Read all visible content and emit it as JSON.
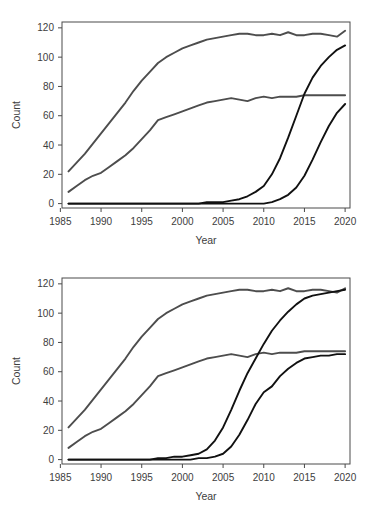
{
  "figure": {
    "watermark_text": "",
    "background_color": "#ffffff",
    "frame_color": "#4a4a4a",
    "gray_series_color": "#4d4d4d",
    "black_series_color": "#111111"
  },
  "charts": [
    {
      "id": "chart-top",
      "type": "line",
      "title": "",
      "xlabel": "Year",
      "ylabel": "Count",
      "xlim": [
        1985.2,
        2020.6
      ],
      "ylim": [
        -3,
        124
      ],
      "xticks": [
        1985,
        1990,
        1995,
        2000,
        2005,
        2010,
        2015,
        2020
      ],
      "xticklabels": [
        "1985",
        "1990",
        "1995",
        "2000",
        "2005",
        "2010",
        "2015",
        "2020"
      ],
      "yticks": [
        0,
        20,
        40,
        60,
        80,
        100,
        120
      ],
      "yticklabels": [
        "0",
        "20",
        "40",
        "60",
        "80",
        "100",
        "120"
      ],
      "grid": false,
      "legend": "none",
      "x": [
        1986,
        1987,
        1988,
        1989,
        1990,
        1991,
        1992,
        1993,
        1994,
        1995,
        1996,
        1997,
        1998,
        1999,
        2000,
        2001,
        2002,
        2003,
        2004,
        2005,
        2006,
        2007,
        2008,
        2009,
        2010,
        2011,
        2012,
        2013,
        2014,
        2015,
        2016,
        2017,
        2018,
        2019,
        2020
      ],
      "series": [
        {
          "name": "series-1-gray-upper",
          "color": "#4d4d4d",
          "values": [
            22,
            28,
            34,
            41,
            48,
            55,
            62,
            69,
            77,
            84,
            90,
            96,
            100,
            103,
            106,
            108,
            110,
            112,
            113,
            114,
            115,
            116,
            116,
            115,
            115,
            116,
            115,
            117,
            115,
            115,
            116,
            116,
            115,
            114,
            118
          ]
        },
        {
          "name": "series-2-gray-lower",
          "color": "#4d4d4d",
          "values": [
            8,
            12,
            16,
            19,
            21,
            25,
            29,
            33,
            38,
            44,
            50,
            57,
            59,
            61,
            63,
            65,
            67,
            69,
            70,
            71,
            72,
            71,
            70,
            72,
            73,
            72,
            73,
            73,
            73,
            74,
            74,
            74,
            74,
            74,
            74
          ]
        },
        {
          "name": "series-3-black-steep",
          "color": "#111111",
          "values": [
            0,
            0,
            0,
            0,
            0,
            0,
            0,
            0,
            0,
            0,
            0,
            0,
            0,
            0,
            0,
            0,
            0,
            1,
            1,
            1,
            2,
            3,
            5,
            8,
            12,
            20,
            31,
            45,
            60,
            75,
            86,
            94,
            100,
            105,
            108
          ]
        },
        {
          "name": "series-4-black-late",
          "color": "#111111",
          "values": [
            0,
            0,
            0,
            0,
            0,
            0,
            0,
            0,
            0,
            0,
            0,
            0,
            0,
            0,
            0,
            0,
            0,
            0,
            0,
            0,
            0,
            0,
            0,
            0,
            0,
            1,
            3,
            6,
            11,
            19,
            30,
            42,
            53,
            62,
            68
          ]
        }
      ]
    },
    {
      "id": "chart-bottom",
      "type": "line",
      "title": "",
      "xlabel": "Year",
      "ylabel": "Count",
      "xlim": [
        1985.2,
        2020.6
      ],
      "ylim": [
        -3,
        124
      ],
      "xticks": [
        1985,
        1990,
        1995,
        2000,
        2005,
        2010,
        2015,
        2020
      ],
      "xticklabels": [
        "1985",
        "1990",
        "1995",
        "2000",
        "2005",
        "2010",
        "2015",
        "2020"
      ],
      "yticks": [
        0,
        20,
        40,
        60,
        80,
        100,
        120
      ],
      "yticklabels": [
        "0",
        "20",
        "40",
        "60",
        "80",
        "100",
        "120"
      ],
      "grid": false,
      "legend": "none",
      "x": [
        1986,
        1987,
        1988,
        1989,
        1990,
        1991,
        1992,
        1993,
        1994,
        1995,
        1996,
        1997,
        1998,
        1999,
        2000,
        2001,
        2002,
        2003,
        2004,
        2005,
        2006,
        2007,
        2008,
        2009,
        2010,
        2011,
        2012,
        2013,
        2014,
        2015,
        2016,
        2017,
        2018,
        2019,
        2020
      ],
      "series": [
        {
          "name": "series-1-gray-upper",
          "color": "#4d4d4d",
          "values": [
            22,
            28,
            34,
            41,
            48,
            55,
            62,
            69,
            77,
            84,
            90,
            96,
            100,
            103,
            106,
            108,
            110,
            112,
            113,
            114,
            115,
            116,
            116,
            115,
            115,
            116,
            115,
            117,
            115,
            115,
            116,
            116,
            115,
            114,
            117
          ]
        },
        {
          "name": "series-2-gray-lower",
          "color": "#4d4d4d",
          "values": [
            8,
            12,
            16,
            19,
            21,
            25,
            29,
            33,
            38,
            44,
            50,
            57,
            59,
            61,
            63,
            65,
            67,
            69,
            70,
            71,
            72,
            71,
            70,
            72,
            73,
            72,
            73,
            73,
            73,
            74,
            74,
            74,
            74,
            74,
            74
          ]
        },
        {
          "name": "series-3-black-steep",
          "color": "#111111",
          "values": [
            0,
            0,
            0,
            0,
            0,
            0,
            0,
            0,
            0,
            0,
            0,
            1,
            1,
            2,
            2,
            3,
            4,
            7,
            13,
            22,
            34,
            47,
            59,
            69,
            79,
            88,
            95,
            101,
            106,
            110,
            112,
            113,
            114,
            115,
            116
          ]
        },
        {
          "name": "series-4-black-late",
          "color": "#111111",
          "values": [
            0,
            0,
            0,
            0,
            0,
            0,
            0,
            0,
            0,
            0,
            0,
            0,
            0,
            0,
            0,
            0,
            1,
            1,
            2,
            4,
            9,
            17,
            27,
            38,
            46,
            50,
            57,
            62,
            66,
            69,
            70,
            71,
            71,
            72,
            72
          ]
        }
      ]
    }
  ]
}
